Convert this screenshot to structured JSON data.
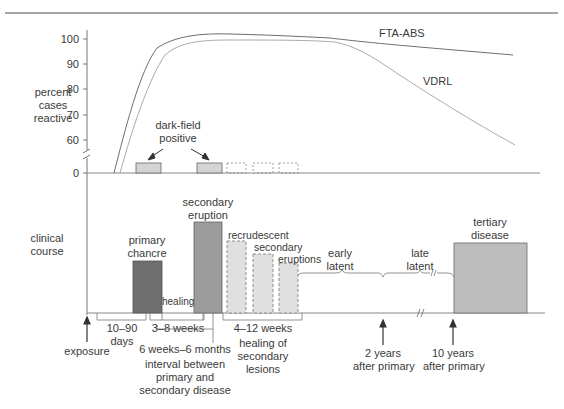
{
  "top_panel": {
    "y_axis_label": [
      "percent",
      "cases",
      "reactive"
    ],
    "y_ticks": [
      "100",
      "90",
      "80",
      "70",
      "60",
      "0"
    ],
    "series_labels": {
      "fta_abs": "FTA-ABS",
      "vdrl": "VDRL"
    },
    "darkfield_label": [
      "dark-field",
      "positive"
    ]
  },
  "bottom_panel": {
    "y_axis_label": [
      "clinical",
      "course"
    ],
    "bars": {
      "primary_chancre": [
        "primary",
        "chancre"
      ],
      "secondary_eruption": [
        "secondary",
        "eruption"
      ],
      "recrudescent": [
        "recrudescent",
        "secondary",
        "eruptions"
      ],
      "tertiary": [
        "tertiary",
        "disease"
      ],
      "healing": "healing"
    },
    "latent": {
      "early": [
        "early",
        "latent"
      ],
      "late": [
        "late",
        "latent"
      ]
    }
  },
  "timeline": {
    "exposure": "exposure",
    "days": [
      "10–90",
      "days"
    ],
    "weeks_3_8": "3–8 weeks",
    "interval": [
      "6 weeks–6 months",
      "interval between",
      "primary and",
      "secondary disease"
    ],
    "weeks_4_12": "4–12 weeks",
    "healing_secondary": [
      "healing of",
      "secondary",
      "lesions"
    ],
    "two_years": [
      "2 years",
      "after primary"
    ],
    "ten_years": [
      "10 years",
      "after primary"
    ]
  },
  "colors": {
    "primary": "#6e6e6e",
    "secondary": "#9c9c9c",
    "recrudescent": "#dcdcdc",
    "tertiary": "#bdbdbd",
    "darkfield": "#d4d4d4",
    "axis": "#777777",
    "fta_line": "#6e6e6e",
    "vdrl_line": "#aaaaaa"
  }
}
